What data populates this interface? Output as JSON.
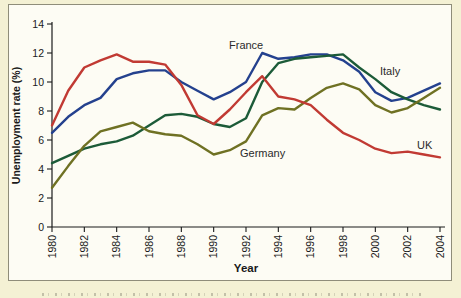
{
  "figure": {
    "background_color": "#f4f1d4",
    "panel_color": "#fdfcf4",
    "frame_color": "#8f8d7a",
    "axis_color": "#1a1a1a"
  },
  "chart_data": {
    "type": "line",
    "title": "",
    "xlabel": "Year",
    "ylabel": "Unemployment rate (%)",
    "xlim": [
      1980,
      2004
    ],
    "ylim": [
      0,
      14
    ],
    "x_ticks": [
      1980,
      1982,
      1984,
      1986,
      1988,
      1990,
      1992,
      1994,
      1996,
      1998,
      2000,
      2002,
      2004
    ],
    "y_ticks": [
      0,
      2,
      4,
      6,
      8,
      10,
      12,
      14
    ],
    "x_tick_rotation_deg": -90,
    "grid": false,
    "legend_position": "inline-labels",
    "x": [
      1980,
      1981,
      1982,
      1983,
      1984,
      1985,
      1986,
      1987,
      1988,
      1989,
      1990,
      1991,
      1992,
      1993,
      1994,
      1995,
      1996,
      1997,
      1998,
      1999,
      2000,
      2001,
      2002,
      2003,
      2004
    ],
    "series": [
      {
        "name": "France",
        "color": "#24418e",
        "values": [
          6.5,
          7.6,
          8.4,
          8.9,
          10.2,
          10.6,
          10.8,
          10.8,
          10.0,
          9.4,
          8.8,
          9.3,
          10.0,
          12.0,
          11.6,
          11.7,
          11.9,
          11.9,
          11.5,
          10.7,
          9.3,
          8.7,
          8.9,
          9.4,
          9.9
        ]
      },
      {
        "name": "Italy",
        "color": "#1c5b38",
        "values": [
          4.4,
          4.9,
          5.4,
          5.7,
          5.9,
          6.3,
          7.0,
          7.7,
          7.8,
          7.6,
          7.1,
          6.9,
          7.5,
          10.0,
          11.3,
          11.6,
          11.7,
          11.8,
          11.9,
          11.0,
          10.2,
          9.3,
          8.8,
          8.4,
          8.1
        ]
      },
      {
        "name": "Germany",
        "color": "#6f7123",
        "values": [
          2.7,
          4.2,
          5.6,
          6.6,
          6.9,
          7.2,
          6.6,
          6.4,
          6.3,
          5.7,
          5.0,
          5.3,
          5.9,
          7.7,
          8.2,
          8.1,
          8.9,
          9.6,
          9.9,
          9.5,
          8.4,
          7.9,
          8.2,
          8.9,
          9.6
        ]
      },
      {
        "name": "UK",
        "color": "#c13a33",
        "values": [
          7.0,
          9.4,
          11.0,
          11.5,
          11.9,
          11.4,
          11.4,
          11.2,
          9.8,
          7.7,
          7.1,
          8.1,
          9.3,
          10.4,
          9.0,
          8.8,
          8.4,
          7.4,
          6.5,
          6.0,
          5.4,
          5.1,
          5.2,
          5.0,
          4.8
        ]
      }
    ]
  }
}
